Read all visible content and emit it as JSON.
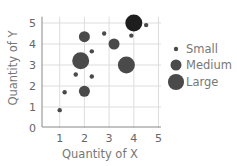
{
  "chart_data": {
    "type": "scatter",
    "subtype": "bubble",
    "title": "",
    "xlabel": "Quantity of X",
    "ylabel": "Quantity of Y",
    "xlim": [
      0,
      5
    ],
    "ylim": [
      0,
      5
    ],
    "xticks": [
      "1",
      "2",
      "3",
      "4",
      "5"
    ],
    "yticks": [
      "0",
      "1",
      "2",
      "3",
      "4",
      "5"
    ],
    "grid": true,
    "legend_position": "right",
    "legend": [
      {
        "label": "Small",
        "size": "small"
      },
      {
        "label": "Medium",
        "size": "medium"
      },
      {
        "label": "Large",
        "size": "large"
      }
    ],
    "points": [
      {
        "x": 1.0,
        "y": 0.85,
        "size": "small"
      },
      {
        "x": 1.2,
        "y": 1.7,
        "size": "small"
      },
      {
        "x": 2.0,
        "y": 1.75,
        "size": "medium"
      },
      {
        "x": 1.65,
        "y": 2.55,
        "size": "small"
      },
      {
        "x": 2.3,
        "y": 2.45,
        "size": "small"
      },
      {
        "x": 1.85,
        "y": 3.2,
        "size": "large"
      },
      {
        "x": 2.3,
        "y": 3.65,
        "size": "small"
      },
      {
        "x": 2.0,
        "y": 4.35,
        "size": "medium"
      },
      {
        "x": 2.8,
        "y": 4.5,
        "size": "small"
      },
      {
        "x": 3.2,
        "y": 4.0,
        "size": "medium"
      },
      {
        "x": 3.7,
        "y": 3.0,
        "size": "large"
      },
      {
        "x": 3.9,
        "y": 4.4,
        "size": "small"
      },
      {
        "x": 4.0,
        "y": 5.0,
        "size": "large",
        "highlight": true
      },
      {
        "x": 4.5,
        "y": 4.9,
        "size": "small"
      }
    ],
    "colors": {
      "point": "#4a4a4a",
      "highlight": "#1e1e1e",
      "grid": "#dddddd",
      "axis": "#888888"
    }
  }
}
